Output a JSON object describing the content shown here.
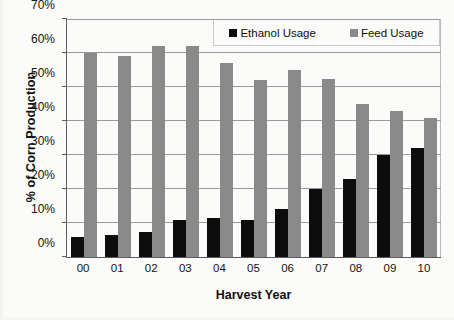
{
  "chart_data": {
    "type": "bar",
    "title": "",
    "xlabel": "Harvest Year",
    "ylabel": "% of Corn Production",
    "categories": [
      "00",
      "01",
      "02",
      "03",
      "04",
      "05",
      "06",
      "07",
      "08",
      "09",
      "10"
    ],
    "series": [
      {
        "name": "Ethanol Usage",
        "color": "#0d0d0d",
        "values": [
          6,
          6.5,
          7.5,
          11,
          11.5,
          11,
          14,
          20,
          23,
          30,
          32
        ]
      },
      {
        "name": "Feed Usage",
        "color": "#8a8a8a",
        "values": [
          60,
          59,
          62,
          62,
          57,
          52,
          55,
          52.5,
          45,
          43,
          41
        ]
      }
    ],
    "ylim": [
      0,
      70
    ],
    "y_ticks": [
      "0%",
      "10%",
      "20%",
      "30%",
      "40%",
      "50%",
      "60%",
      "70%"
    ],
    "y_tick_values": [
      0,
      10,
      20,
      30,
      40,
      50,
      60,
      70
    ],
    "grid": true,
    "legend_position": "top-right"
  },
  "legend": {
    "items": [
      {
        "label": "Ethanol Usage",
        "swatch": "ethanol-swatch-icon"
      },
      {
        "label": "Feed Usage",
        "swatch": "feed-swatch-icon"
      }
    ]
  }
}
